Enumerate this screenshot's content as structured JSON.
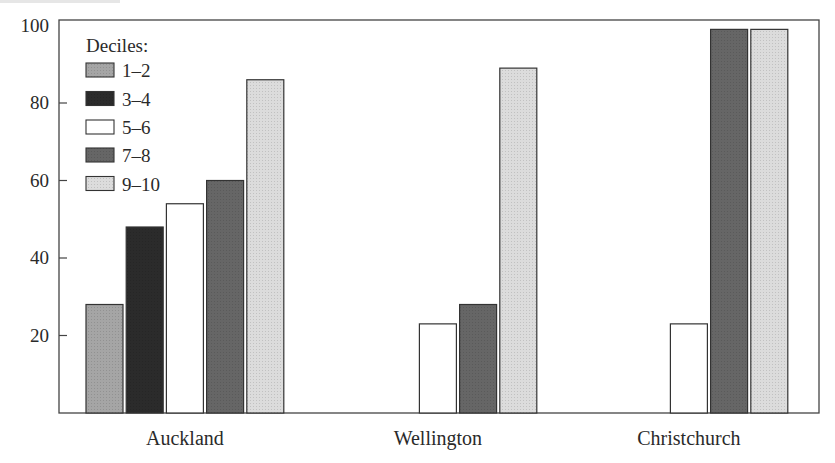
{
  "chart_data": {
    "type": "bar",
    "title": "",
    "xlabel": "",
    "ylabel": "",
    "ylim": [
      0,
      100
    ],
    "yticks": [
      20,
      40,
      60,
      80,
      100
    ],
    "grid": false,
    "legend_position": "top-left inside",
    "legend_title": "Deciles:",
    "categories": [
      "Auckland",
      "Wellington",
      "Christchurch"
    ],
    "series": [
      {
        "name": "1–2",
        "color": "#a5a5a5",
        "values": [
          28,
          null,
          null
        ]
      },
      {
        "name": "3–4",
        "color": "#2b2b2b",
        "values": [
          48,
          null,
          null
        ]
      },
      {
        "name": "5–6",
        "color": "#ffffff",
        "values": [
          54,
          23,
          23
        ]
      },
      {
        "name": "7–8",
        "color": "#666666",
        "values": [
          60,
          28,
          99
        ]
      },
      {
        "name": "9–10",
        "color": "#dcdcdc",
        "values": [
          86,
          89,
          99
        ]
      }
    ]
  }
}
